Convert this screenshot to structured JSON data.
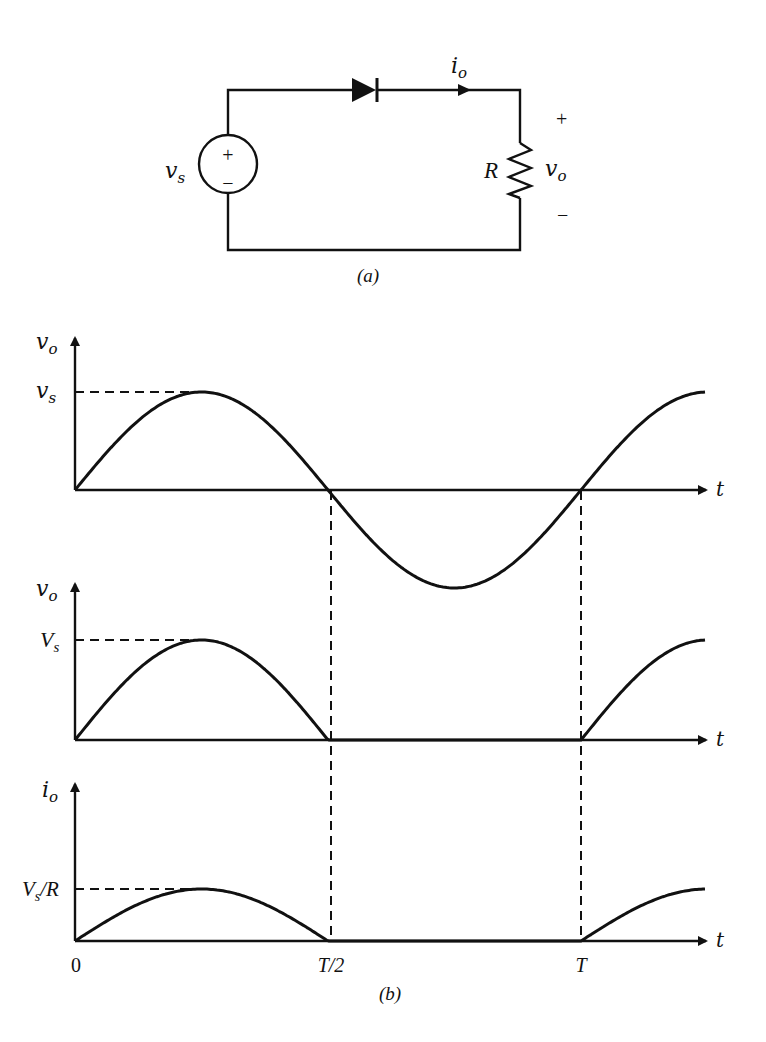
{
  "figure": {
    "part_a": {
      "caption": "(a)",
      "source_label": "v",
      "source_label_sub": "s",
      "source_plus": "+",
      "source_minus": "−",
      "current_label": "i",
      "current_label_sub": "o",
      "resistor_label": "R",
      "output_label": "v",
      "output_label_sub": "o",
      "output_plus": "+",
      "output_minus": "−"
    },
    "part_b": {
      "caption": "(b)",
      "x_axis_label": "t",
      "x_ticks": [
        "0",
        "T/2",
        "T"
      ]
    }
  },
  "chart_data": [
    {
      "type": "line",
      "title": "Source voltage v_s(t)",
      "ylabel": "v_o",
      "xlabel": "t",
      "peak_label": "v_s",
      "x": [
        "0",
        "T/4",
        "T/2",
        "3T/4",
        "T",
        "5T/4"
      ],
      "values": [
        0,
        1,
        0,
        -1,
        0,
        1
      ],
      "description": "Full sinusoid v_s(t) = V_s sin(2πt/T)"
    },
    {
      "type": "line",
      "title": "Output voltage v_o(t) (half-wave rectified)",
      "ylabel": "v_o",
      "xlabel": "t",
      "peak_label": "V_s",
      "x": [
        "0",
        "T/4",
        "T/2",
        "3T/4",
        "T",
        "5T/4"
      ],
      "values": [
        0,
        1,
        0,
        0,
        0,
        1
      ],
      "description": "Positive half cycles pass; zero from T/2 to T"
    },
    {
      "type": "line",
      "title": "Output current i_o(t)",
      "ylabel": "i_o",
      "xlabel": "t",
      "peak_label": "V_s/R",
      "x": [
        "0",
        "T/4",
        "T/2",
        "3T/4",
        "T",
        "5T/4"
      ],
      "values": [
        0,
        1,
        0,
        0,
        0,
        1
      ],
      "description": "Current follows v_o/R; peak V_s/R"
    }
  ]
}
